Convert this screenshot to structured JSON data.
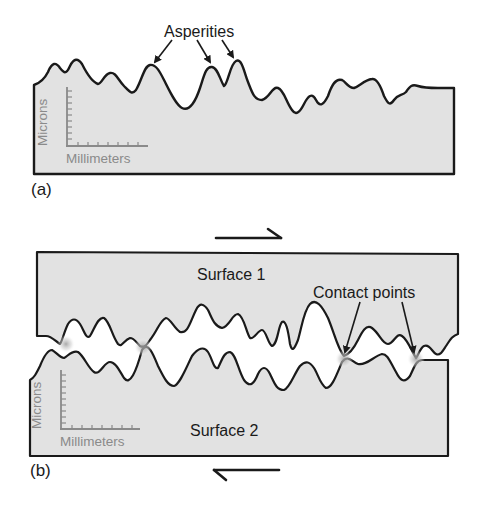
{
  "figure": {
    "colors": {
      "fill": "#e2e2e2",
      "stroke": "#1a1a1a",
      "axis": "#8a8a8a",
      "contact_glow": "#b8b8b8",
      "background": "#ffffff"
    }
  },
  "panel_a": {
    "label": "(a)",
    "callout": "Asperities",
    "axis": {
      "y_label": "Microns",
      "x_label": "Millimeters"
    }
  },
  "panel_b": {
    "label": "(b)",
    "surface_top": "Surface 1",
    "surface_bottom": "Surface 2",
    "callout": "Contact points",
    "axis": {
      "y_label": "Microns",
      "x_label": "Millimeters"
    },
    "motion": {
      "top": "right",
      "bottom": "left"
    }
  }
}
